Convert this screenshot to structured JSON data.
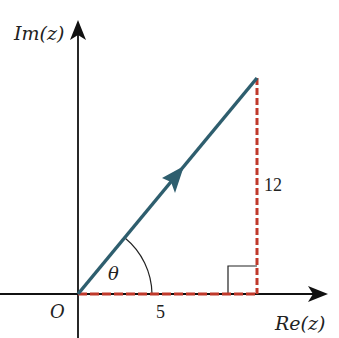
{
  "diagram": {
    "type": "argand-diagram",
    "axes": {
      "y_label": "Im(z)",
      "x_label": "Re(z)",
      "origin_label": "O"
    },
    "vector": {
      "from": [
        0,
        0
      ],
      "to": [
        5,
        12
      ],
      "color": "#2e5e6e"
    },
    "angle_label": "θ",
    "real_part_label": "5",
    "imag_part_label": "12",
    "dashed_color": "#c0392b",
    "right_angle_marker": true
  }
}
